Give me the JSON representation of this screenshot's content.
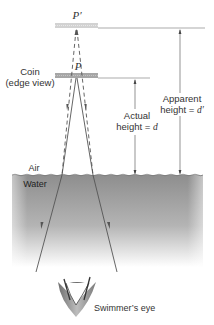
{
  "diagram": {
    "labels": {
      "p_prime": "P′",
      "p": "P",
      "coin_line1": "Coin",
      "coin_line2": "(edge view)",
      "actual_line1": "Actual",
      "actual_line2": "height = ",
      "actual_var": "d",
      "apparent_line1": "Apparent",
      "apparent_line2": "height = ",
      "apparent_var": "d′",
      "air": "Air",
      "water": "Water",
      "eye": "Swimmer’s eye"
    },
    "colors": {
      "water_top": "#8e8e8e",
      "water_bottom": "#ffffff",
      "coin": "#a8a8a8",
      "image_coin": "#cfcfcf",
      "ray": "#555555",
      "line": "#777777"
    }
  }
}
